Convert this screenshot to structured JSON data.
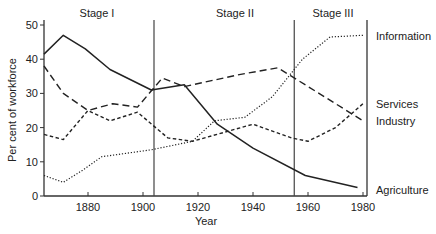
{
  "chart_data": {
    "type": "line",
    "title": "",
    "xlabel": "Year",
    "ylabel": "Per cent of workforce",
    "xlim": [
      1864,
      1982
    ],
    "ylim": [
      0,
      50
    ],
    "x_ticks": [
      1880,
      1900,
      1920,
      1940,
      1960,
      1980
    ],
    "y_ticks": [
      0,
      10,
      20,
      30,
      40,
      50
    ],
    "grid": false,
    "legend_position": "right (direct labels)",
    "stages": [
      {
        "label": "Stage I",
        "start": 1864,
        "end": 1904
      },
      {
        "label": "Stage II",
        "start": 1904,
        "end": 1955
      },
      {
        "label": "Stage III",
        "start": 1955,
        "end": 1982
      }
    ],
    "series": [
      {
        "name": "Information",
        "style": "dotted",
        "x": [
          1864,
          1871,
          1878,
          1885,
          1903,
          1918,
          1926,
          1937,
          1947,
          1958,
          1968,
          1980
        ],
        "values": [
          6,
          4,
          7.5,
          11.5,
          13.5,
          16,
          22,
          23,
          29,
          40,
          46.5,
          47
        ]
      },
      {
        "name": "Services",
        "style": "long-dash",
        "x": [
          1864,
          1871,
          1880,
          1889,
          1898,
          1907,
          1915,
          1935,
          1949,
          1956,
          1966,
          1980
        ],
        "values": [
          38,
          30,
          25,
          27,
          26,
          34.5,
          32,
          35.5,
          37.5,
          34,
          29,
          22
        ]
      },
      {
        "name": "Industry",
        "style": "short-dash",
        "x": [
          1864,
          1871,
          1880,
          1888,
          1898,
          1909,
          1918,
          1940,
          1954,
          1960,
          1970,
          1980
        ],
        "values": [
          18,
          16.5,
          25,
          22,
          24.5,
          17,
          16,
          21,
          17,
          16,
          20,
          27
        ]
      },
      {
        "name": "Agriculture",
        "style": "solid",
        "x": [
          1864,
          1871,
          1879,
          1888,
          1903,
          1915,
          1927,
          1940,
          1959,
          1978
        ],
        "values": [
          41.5,
          47,
          43,
          37,
          31,
          32.5,
          21,
          14,
          6,
          2.5
        ]
      }
    ]
  },
  "labels": {
    "stage1": "Stage I",
    "stage2": "Stage II",
    "stage3": "Stage III",
    "xlabel": "Year",
    "ylabel": "Per cent of workforce",
    "information": "Information",
    "services": "Services",
    "industry": "Industry",
    "agriculture": "Agriculture"
  }
}
